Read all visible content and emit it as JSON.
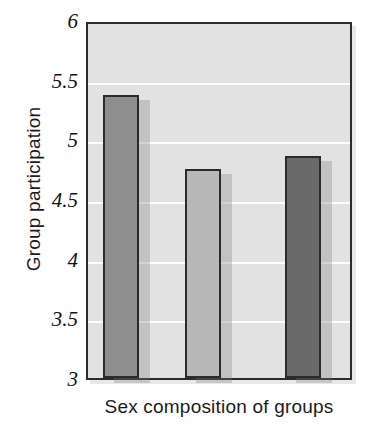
{
  "chart_data": {
    "type": "bar",
    "title": "",
    "xlabel": "Sex composition of groups",
    "ylabel": "Group participation",
    "categories": [
      "",
      "",
      ""
    ],
    "values": [
      5.37,
      4.75,
      4.86
    ],
    "bar_colors": [
      "#8e8e8e",
      "#b8b8b8",
      "#6a6a6a"
    ],
    "ylim": [
      3,
      6
    ],
    "yticks": [
      "3",
      "3.5",
      "4",
      "4.5",
      "5",
      "5.5",
      "6"
    ],
    "ytick_values": [
      3,
      3.5,
      4,
      4.5,
      5,
      5.5,
      6
    ],
    "xticks": [],
    "grid": "horizontal",
    "legend": "none",
    "plot_background": "#e2e2e2",
    "gridline_color": "#fdfdfd",
    "axis_color": "#2b2b2b"
  },
  "axes": {
    "y_title": "Group participation",
    "x_title": "Sex composition of groups"
  }
}
